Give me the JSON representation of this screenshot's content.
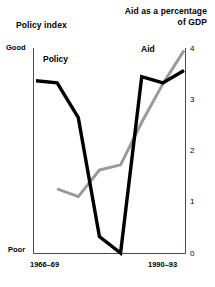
{
  "chart_data": {
    "type": "line",
    "title": "",
    "left_axis": {
      "label": "Policy index",
      "top_label": "Good",
      "bottom_label": "Poor",
      "ticks": []
    },
    "right_axis": {
      "label_line1": "Aid as a percentage",
      "label_line2": "of GDP",
      "ticks": [
        "0",
        "1",
        "2",
        "3",
        "4"
      ],
      "ylim": [
        0,
        4
      ]
    },
    "xlabel": "",
    "xtick_labels": [
      "1966–69",
      "1990–93"
    ],
    "grid": false,
    "legend_position": "inline-annotations",
    "series": [
      {
        "name": "Policy",
        "axis": "left",
        "color": "#000000",
        "label": "Policy",
        "x": [
          0,
          1,
          2,
          3,
          4,
          5,
          6,
          7
        ],
        "values_pct_of_range": [
          84,
          83,
          66,
          8,
          0,
          86,
          83,
          89
        ]
      },
      {
        "name": "Aid",
        "axis": "right",
        "color": "#9a9a9a",
        "label": "Aid",
        "x": [
          1,
          2,
          3,
          4,
          5,
          6,
          7
        ],
        "values": [
          1.25,
          1.1,
          1.62,
          1.72,
          2.55,
          3.3,
          3.95
        ]
      }
    ]
  },
  "series_labels": {
    "policy": "Policy",
    "aid": "Aid"
  }
}
